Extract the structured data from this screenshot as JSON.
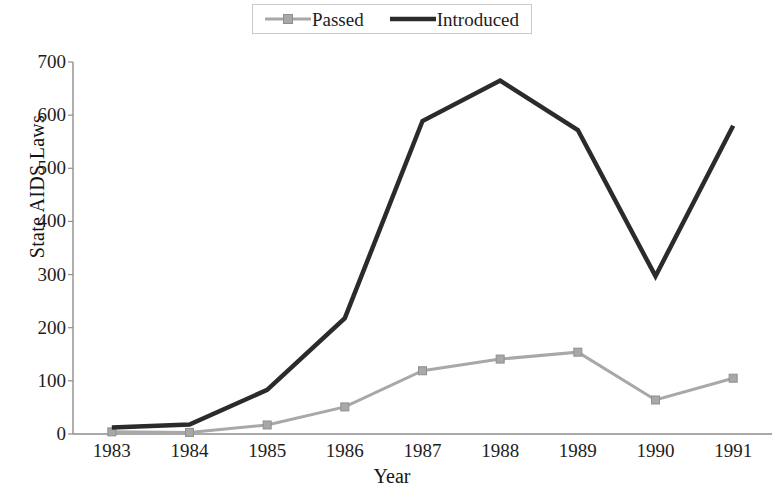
{
  "chart_data": {
    "type": "line",
    "title": "",
    "xlabel": "Year",
    "ylabel": "State AIDS Laws",
    "categories": [
      "1983",
      "1984",
      "1985",
      "1986",
      "1987",
      "1988",
      "1989",
      "1990",
      "1991"
    ],
    "x": [
      1983,
      1984,
      1985,
      1986,
      1987,
      1988,
      1989,
      1990,
      1991
    ],
    "ylim": [
      0,
      700
    ],
    "yticks": [
      0,
      100,
      200,
      300,
      400,
      500,
      600,
      700
    ],
    "ytick_labels": [
      "0",
      "100",
      "200",
      "300",
      "400",
      "500",
      "600",
      "700"
    ],
    "grid": false,
    "legend_position": "top-center",
    "series": [
      {
        "name": "Passed",
        "color": "#a8a8a8",
        "marker": "square",
        "line_width": 3,
        "values": [
          4,
          3,
          17,
          51,
          119,
          141,
          154,
          64,
          105
        ]
      },
      {
        "name": "Introduced",
        "color": "#2b2b2b",
        "marker": "none",
        "line_width": 4.5,
        "values": [
          12,
          18,
          83,
          218,
          589,
          665,
          572,
          297,
          580
        ]
      }
    ]
  },
  "legend": {
    "entries": [
      {
        "label": "Passed"
      },
      {
        "label": "Introduced"
      }
    ]
  },
  "axes": {
    "y_title": "State AIDS Laws",
    "x_title": "Year",
    "axis_color": "#8d8d8d"
  }
}
